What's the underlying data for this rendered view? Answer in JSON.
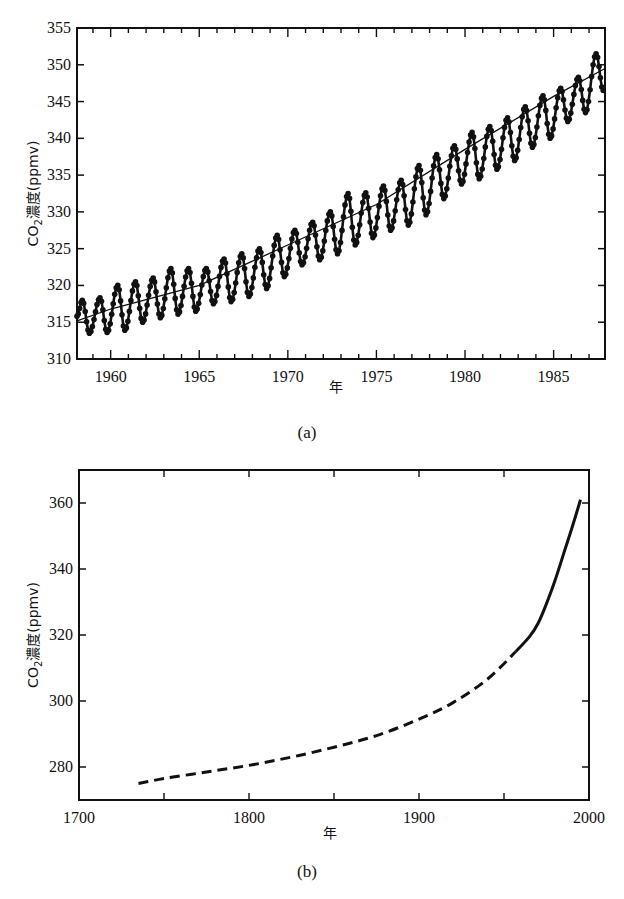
{
  "chart_data": [
    {
      "id": "a",
      "type": "line",
      "caption": "(a)",
      "title": "",
      "xlabel": "年",
      "ylabel_main": "CO",
      "ylabel_sub": "2",
      "ylabel_rest": "濃度(ppmv)",
      "xlim": [
        1958.1,
        1987.9
      ],
      "ylim": [
        310,
        355
      ],
      "xticks": [
        1960,
        1965,
        1970,
        1975,
        1980,
        1985
      ],
      "xtick_labels": [
        "1960",
        "1965",
        "1970",
        "1975",
        "1980",
        "1985"
      ],
      "yticks": [
        310,
        315,
        320,
        325,
        330,
        335,
        340,
        345,
        350,
        355
      ],
      "ytick_labels": [
        "310",
        "315",
        "320",
        "325",
        "330",
        "335",
        "340",
        "345",
        "350",
        "355"
      ],
      "grid": false,
      "legend": null,
      "series": [
        {
          "name": "monthly CO2 (seasonal cycle)",
          "style": "line-with-dots",
          "description": "Monthly Mauna Loa-style record with ~6 ppmv annual oscillation; peaks ~May, troughs ~Oct",
          "annual_peaks": [
            {
              "x": 1958.4,
              "y": 318.0
            },
            {
              "x": 1959.4,
              "y": 318.3
            },
            {
              "x": 1960.4,
              "y": 320.0
            },
            {
              "x": 1961.4,
              "y": 320.5
            },
            {
              "x": 1962.4,
              "y": 321.0
            },
            {
              "x": 1963.4,
              "y": 322.3
            },
            {
              "x": 1964.4,
              "y": 322.3
            },
            {
              "x": 1965.4,
              "y": 322.3
            },
            {
              "x": 1966.4,
              "y": 323.6
            },
            {
              "x": 1967.4,
              "y": 324.3
            },
            {
              "x": 1968.4,
              "y": 325.0
            },
            {
              "x": 1969.4,
              "y": 326.8
            },
            {
              "x": 1970.4,
              "y": 327.5
            },
            {
              "x": 1971.4,
              "y": 328.6
            },
            {
              "x": 1972.4,
              "y": 330.0
            },
            {
              "x": 1973.4,
              "y": 332.5
            },
            {
              "x": 1974.4,
              "y": 332.6
            },
            {
              "x": 1975.4,
              "y": 333.5
            },
            {
              "x": 1976.4,
              "y": 334.3
            },
            {
              "x": 1977.4,
              "y": 336.3
            },
            {
              "x": 1978.4,
              "y": 337.8
            },
            {
              "x": 1979.4,
              "y": 339.0
            },
            {
              "x": 1980.4,
              "y": 340.8
            },
            {
              "x": 1981.4,
              "y": 341.6
            },
            {
              "x": 1982.4,
              "y": 342.8
            },
            {
              "x": 1983.4,
              "y": 344.3
            },
            {
              "x": 1984.4,
              "y": 345.8
            },
            {
              "x": 1985.4,
              "y": 346.8
            },
            {
              "x": 1986.4,
              "y": 348.3
            },
            {
              "x": 1987.4,
              "y": 351.5
            }
          ],
          "annual_troughs": [
            {
              "x": 1958.8,
              "y": 313.5
            },
            {
              "x": 1959.8,
              "y": 313.6
            },
            {
              "x": 1960.8,
              "y": 313.9
            },
            {
              "x": 1961.8,
              "y": 315.0
            },
            {
              "x": 1962.8,
              "y": 315.6
            },
            {
              "x": 1963.8,
              "y": 316.1
            },
            {
              "x": 1964.8,
              "y": 316.5
            },
            {
              "x": 1965.8,
              "y": 317.5
            },
            {
              "x": 1966.8,
              "y": 317.8
            },
            {
              "x": 1967.8,
              "y": 318.5
            },
            {
              "x": 1968.8,
              "y": 319.6
            },
            {
              "x": 1969.8,
              "y": 321.2
            },
            {
              "x": 1970.8,
              "y": 322.8
            },
            {
              "x": 1971.8,
              "y": 323.5
            },
            {
              "x": 1972.8,
              "y": 324.3
            },
            {
              "x": 1973.8,
              "y": 325.5
            },
            {
              "x": 1974.8,
              "y": 326.5
            },
            {
              "x": 1975.8,
              "y": 327.5
            },
            {
              "x": 1976.8,
              "y": 328.2
            },
            {
              "x": 1977.8,
              "y": 329.6
            },
            {
              "x": 1978.8,
              "y": 331.8
            },
            {
              "x": 1979.8,
              "y": 333.8
            },
            {
              "x": 1980.8,
              "y": 334.5
            },
            {
              "x": 1981.8,
              "y": 335.8
            },
            {
              "x": 1982.8,
              "y": 337.0
            },
            {
              "x": 1983.8,
              "y": 338.8
            },
            {
              "x": 1984.8,
              "y": 340.0
            },
            {
              "x": 1985.8,
              "y": 342.3
            },
            {
              "x": 1986.8,
              "y": 343.5
            },
            {
              "x": 1987.8,
              "y": 346.5
            }
          ]
        },
        {
          "name": "trend (annual mean)",
          "style": "thin-solid",
          "x": [
            1958.1,
            1960,
            1965,
            1970,
            1975,
            1980,
            1985,
            1987.9
          ],
          "values": [
            315.2,
            316.8,
            320.0,
            325.5,
            331.0,
            338.5,
            345.7,
            349.5
          ]
        }
      ]
    },
    {
      "id": "b",
      "type": "line",
      "caption": "(b)",
      "title": "",
      "xlabel": "年",
      "ylabel_main": "CO",
      "ylabel_sub": "2",
      "ylabel_rest": "濃度(ppmv)",
      "xlim": [
        1700,
        2000
      ],
      "ylim": [
        270,
        370
      ],
      "xticks": [
        1700,
        1750,
        1800,
        1850,
        1900,
        1950,
        2000
      ],
      "xtick_labels": [
        "1700",
        "",
        "1800",
        "",
        "1900",
        "",
        "2000"
      ],
      "yticks": [
        280,
        300,
        320,
        340,
        360
      ],
      "ytick_labels": [
        "280",
        "300",
        "320",
        "340",
        "360"
      ],
      "grid": false,
      "legend": null,
      "series": [
        {
          "name": "ice-core estimate",
          "style": "dashed",
          "x": [
            1735,
            1750,
            1775,
            1800,
            1825,
            1850,
            1875,
            1900,
            1920,
            1940,
            1957
          ],
          "values": [
            275.0,
            276.5,
            278.5,
            280.5,
            283.0,
            286.0,
            289.5,
            294.5,
            299.5,
            306.5,
            315.0
          ]
        },
        {
          "name": "direct measurement",
          "style": "solid",
          "x": [
            1957,
            1965,
            1970,
            1975,
            1980,
            1985,
            1990,
            1995
          ],
          "values": [
            315.0,
            319.5,
            323.5,
            329.5,
            336.5,
            344.5,
            352.5,
            361.0
          ]
        }
      ]
    }
  ]
}
